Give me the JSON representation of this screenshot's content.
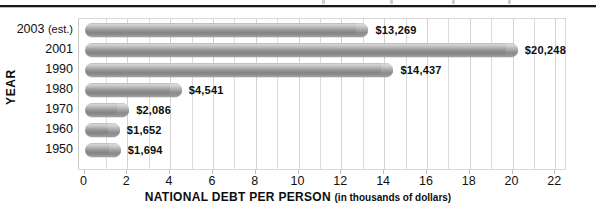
{
  "chart_data": {
    "type": "bar",
    "orientation": "horizontal",
    "title": "",
    "xlabel": "NATIONAL DEBT PER PERSON",
    "xlabel_suffix": "(in thousands of dollars)",
    "ylabel": "YEAR",
    "categories": [
      "2003 (est.)",
      "2001",
      "1990",
      "1980",
      "1970",
      "1960",
      "1950"
    ],
    "values": [
      13.269,
      20.248,
      14.437,
      4.541,
      2.086,
      1.652,
      1.694
    ],
    "value_labels": [
      "$13,269",
      "$20,248",
      "$14,437",
      "$4,541",
      "$2,086",
      "$1,652",
      "$1,694"
    ],
    "xlim": [
      0,
      23
    ],
    "xticks": [
      0,
      2,
      4,
      6,
      8,
      10,
      12,
      14,
      16,
      18,
      20,
      22
    ],
    "xtick_labels": [
      "0",
      "2",
      "4",
      "6",
      "8",
      "10",
      "12",
      "14",
      "16",
      "18",
      "20",
      "22"
    ],
    "minor_gridline_step": 1,
    "grid": true,
    "legend": false,
    "bar_color": "#9a9a9a",
    "bar_style": "cylinder-gradient",
    "units": "thousands of dollars per person"
  },
  "axis": {
    "y_title": "YEAR"
  }
}
